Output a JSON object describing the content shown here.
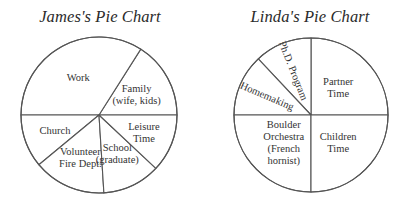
{
  "chart_data": [
    {
      "type": "pie",
      "title": "James's Pie Chart",
      "start_direction": "east",
      "order": "counterclockwise",
      "slices": [
        {
          "label_lines": [
            "Family",
            "(wife, kids)"
          ],
          "value": 16
        },
        {
          "label_lines": [
            "Work"
          ],
          "value": 34
        },
        {
          "label_lines": [
            "Church"
          ],
          "value": 11
        },
        {
          "label_lines": [
            "Volunteer",
            "Fire Dept."
          ],
          "value": 15
        },
        {
          "label_lines": [
            "School",
            "(graduate)"
          ],
          "value": 12
        },
        {
          "label_lines": [
            "Leisure",
            "Time"
          ],
          "value": 12
        }
      ],
      "colors": {
        "fill": "#ffffff",
        "stroke": "#555555",
        "text": "#333333"
      }
    },
    {
      "type": "pie",
      "title": "Linda's Pie Chart",
      "start_direction": "east",
      "order": "counterclockwise",
      "slices": [
        {
          "label_lines": [
            "Partner",
            "Time"
          ],
          "value": 25
        },
        {
          "label_lines": [
            "Ph.D. Program"
          ],
          "value": 12,
          "rotated_label": true
        },
        {
          "label_lines": [
            "Homemaking"
          ],
          "value": 13,
          "rotated_label": true
        },
        {
          "label_lines": [
            "Boulder",
            "Orchestra",
            "(French",
            "hornist)"
          ],
          "value": 25
        },
        {
          "label_lines": [
            "Children",
            "Time"
          ],
          "value": 25
        }
      ],
      "colors": {
        "fill": "#ffffff",
        "stroke": "#555555",
        "text": "#333333"
      }
    }
  ]
}
